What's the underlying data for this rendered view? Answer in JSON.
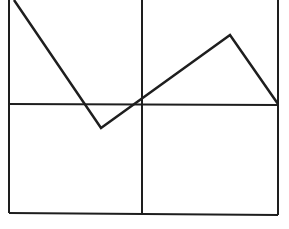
{
  "diagram": {
    "width": 289,
    "height": 229,
    "background": "#ffffff",
    "stroke_color": "#1e1e1e",
    "grid": {
      "stroke_width": 2,
      "lines": [
        {
          "name": "grid-left-vertical",
          "x1": 9,
          "y1": 0,
          "x2": 9,
          "y2": 213
        },
        {
          "name": "grid-middle-vertical",
          "x1": 142,
          "y1": 0,
          "x2": 142,
          "y2": 214
        },
        {
          "name": "grid-right-vertical",
          "x1": 278,
          "y1": 0,
          "x2": 278,
          "y2": 215
        },
        {
          "name": "grid-horizontal-midline",
          "x1": 9,
          "y1": 104,
          "x2": 278,
          "y2": 105
        },
        {
          "name": "grid-bottom-line",
          "x1": 9,
          "y1": 213,
          "x2": 278,
          "y2": 215
        }
      ]
    },
    "polyline": {
      "name": "zigzag-polyline",
      "stroke_width": 2.5,
      "points": [
        [
          14,
          0
        ],
        [
          101,
          128
        ],
        [
          230,
          35
        ],
        [
          278,
          104
        ]
      ]
    }
  }
}
